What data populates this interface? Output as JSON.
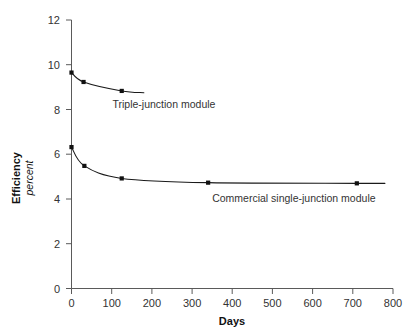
{
  "chart_data": {
    "type": "line",
    "title": "",
    "xlabel": "Days",
    "ylabel": "Efficiency",
    "ylabel_sub": "percent",
    "xlim": [
      0,
      800
    ],
    "ylim": [
      0,
      12
    ],
    "grid": false,
    "legend": "inline-annotations",
    "x_ticks": [
      0,
      100,
      200,
      300,
      400,
      500,
      600,
      700,
      800
    ],
    "x_tick_labels": [
      "0",
      "100",
      "200",
      "300",
      "400",
      "500",
      "600",
      "700",
      "800"
    ],
    "y_ticks": [
      0,
      2,
      4,
      6,
      8,
      10,
      12
    ],
    "y_tick_labels": [
      "0",
      "2",
      "4",
      "6",
      "8",
      "10",
      "12"
    ],
    "series": [
      {
        "name": "Triple-junction module",
        "label": "Triple-junction module",
        "points": [
          {
            "x": 0,
            "y": 9.65
          },
          {
            "x": 30,
            "y": 9.23
          },
          {
            "x": 125,
            "y": 8.83
          },
          {
            "x": 180,
            "y": 8.75
          }
        ],
        "markers": [
          {
            "x": 0,
            "y": 9.65
          },
          {
            "x": 30,
            "y": 9.23
          },
          {
            "x": 125,
            "y": 8.83
          }
        ]
      },
      {
        "name": "Commercial single-junction module",
        "label": "Commercial single-junction module",
        "points": [
          {
            "x": 0,
            "y": 6.32
          },
          {
            "x": 32,
            "y": 5.48
          },
          {
            "x": 125,
            "y": 4.92
          },
          {
            "x": 340,
            "y": 4.73
          },
          {
            "x": 710,
            "y": 4.7
          },
          {
            "x": 780,
            "y": 4.7
          }
        ],
        "markers": [
          {
            "x": 0,
            "y": 6.32
          },
          {
            "x": 32,
            "y": 5.48
          },
          {
            "x": 125,
            "y": 4.92
          },
          {
            "x": 340,
            "y": 4.73
          },
          {
            "x": 710,
            "y": 4.7
          }
        ]
      }
    ],
    "annotations": [
      {
        "text": "Triple-junction module",
        "x": 102,
        "y": 8.05
      },
      {
        "text": "Commercial single-junction module",
        "x": 350,
        "y": 3.85
      }
    ],
    "colors": {
      "curve": "#1a1a1a",
      "axis": "#5a5a5a",
      "text": "#333333",
      "background": "#ffffff"
    }
  }
}
